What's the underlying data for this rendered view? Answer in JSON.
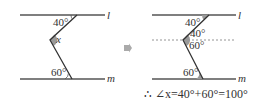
{
  "left_figure": {
    "line_top_label": "l",
    "line_bottom_label": "m",
    "angle_top": "40°",
    "angle_unknown": "x",
    "angle_bottom": "60°"
  },
  "arrow": "arrow-right",
  "right_figure": {
    "line_top_label": "l",
    "line_bottom_label": "m",
    "angle_top": "40°",
    "angle_mid_upper": "40°",
    "angle_mid_lower": "60°",
    "angle_bottom": "60°"
  },
  "conclusion": "∴ ∠x=40°+60°=100°",
  "colors": {
    "line": "#555555",
    "angle_fill": "#9a9a9a",
    "dashed": "#888888"
  }
}
